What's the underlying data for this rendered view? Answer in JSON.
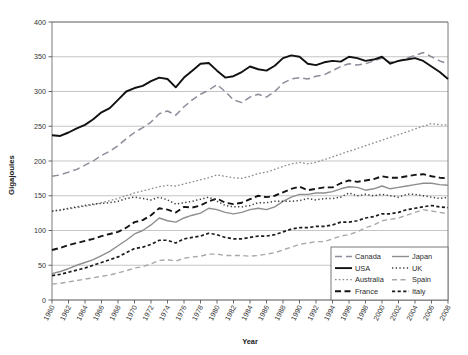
{
  "chart_data": {
    "type": "line",
    "title": "",
    "xlabel": "Year",
    "ylabel": "Gigajoules",
    "xlim": [
      1960,
      2008
    ],
    "ylim": [
      0,
      400
    ],
    "ytick_step": 50,
    "xtick_step": 2,
    "grid": true,
    "legend_position": "bottom-right",
    "yticks": [
      "0",
      "50",
      "100",
      "150",
      "200",
      "250",
      "300",
      "350",
      "400"
    ],
    "xticks": [
      "1960",
      "1962",
      "1964",
      "1966",
      "1968",
      "1970",
      "1972",
      "1974",
      "1976",
      "1978",
      "1980",
      "1982",
      "1984",
      "1986",
      "1988",
      "1990",
      "1992",
      "1994",
      "1996",
      "1998",
      "2000",
      "2002",
      "2004",
      "2006",
      "2008"
    ],
    "x": [
      1960,
      1961,
      1962,
      1963,
      1964,
      1965,
      1966,
      1967,
      1968,
      1969,
      1970,
      1971,
      1972,
      1973,
      1974,
      1975,
      1976,
      1977,
      1978,
      1979,
      1980,
      1981,
      1982,
      1983,
      1984,
      1985,
      1986,
      1987,
      1988,
      1989,
      1990,
      1991,
      1992,
      1993,
      1994,
      1995,
      1996,
      1997,
      1998,
      1999,
      2000,
      2001,
      2002,
      2003,
      2004,
      2005,
      2006,
      2007,
      2008
    ],
    "series": [
      {
        "name": "Canada",
        "style": "dashed",
        "color": "#8c8c9a",
        "width": 1.5,
        "dash": "7,4",
        "values": [
          178,
          180,
          184,
          188,
          194,
          200,
          208,
          214,
          222,
          232,
          241,
          248,
          256,
          268,
          272,
          266,
          278,
          288,
          296,
          302,
          310,
          300,
          288,
          284,
          292,
          296,
          292,
          300,
          312,
          318,
          320,
          318,
          322,
          324,
          330,
          336,
          340,
          338,
          340,
          344,
          348,
          342,
          344,
          348,
          352,
          356,
          350,
          344,
          340
        ]
      },
      {
        "name": "USA",
        "style": "solid",
        "color": "#111111",
        "width": 1.9,
        "dash": "none",
        "values": [
          237,
          236,
          241,
          247,
          252,
          260,
          270,
          276,
          288,
          300,
          305,
          308,
          315,
          320,
          318,
          306,
          320,
          330,
          340,
          341,
          330,
          320,
          322,
          328,
          336,
          332,
          330,
          337,
          348,
          352,
          350,
          340,
          338,
          342,
          344,
          343,
          350,
          348,
          344,
          346,
          350,
          340,
          344,
          346,
          348,
          344,
          336,
          328,
          318
        ]
      },
      {
        "name": "Australia",
        "style": "fine-dotted",
        "color": "#8a8a8a",
        "width": 1.3,
        "dash": "1.6,2.2",
        "values": [
          128,
          130,
          131,
          133,
          135,
          137,
          140,
          143,
          146,
          150,
          154,
          157,
          160,
          163,
          165,
          164,
          167,
          170,
          173,
          176,
          180,
          178,
          176,
          175,
          178,
          182,
          184,
          188,
          192,
          196,
          198,
          196,
          198,
          202,
          206,
          210,
          214,
          218,
          222,
          226,
          230,
          234,
          238,
          242,
          246,
          250,
          254,
          252,
          252
        ]
      },
      {
        "name": "France",
        "style": "long-dash",
        "color": "#141414",
        "width": 1.9,
        "dash": "6,3.5",
        "values": [
          72,
          75,
          79,
          82,
          85,
          88,
          92,
          95,
          98,
          104,
          112,
          115,
          122,
          132,
          130,
          126,
          134,
          133,
          136,
          142,
          146,
          140,
          138,
          140,
          145,
          150,
          148,
          150,
          155,
          160,
          163,
          158,
          160,
          162,
          162,
          168,
          172,
          170,
          172,
          174,
          178,
          176,
          176,
          178,
          180,
          181,
          178,
          176,
          175
        ]
      },
      {
        "name": "Japan",
        "style": "solid-thin",
        "color": "#8e8e8e",
        "width": 1.4,
        "dash": "none",
        "values": [
          38,
          41,
          45,
          50,
          54,
          58,
          64,
          70,
          78,
          86,
          95,
          100,
          108,
          118,
          114,
          112,
          118,
          122,
          125,
          132,
          130,
          126,
          124,
          126,
          130,
          132,
          130,
          134,
          142,
          148,
          152,
          152,
          154,
          154,
          156,
          160,
          163,
          162,
          158,
          160,
          164,
          160,
          162,
          164,
          166,
          168,
          168,
          166,
          165
        ]
      },
      {
        "name": "UK",
        "style": "dotted",
        "color": "#3a3a3a",
        "width": 1.5,
        "dash": "1.3,2.4",
        "values": [
          128,
          129,
          132,
          134,
          136,
          138,
          139,
          140,
          142,
          146,
          148,
          146,
          144,
          148,
          144,
          138,
          140,
          142,
          145,
          148,
          142,
          136,
          134,
          134,
          136,
          140,
          140,
          142,
          142,
          142,
          143,
          146,
          144,
          146,
          146,
          148,
          154,
          150,
          152,
          150,
          152,
          150,
          148,
          152,
          152,
          150,
          148,
          146,
          148
        ]
      },
      {
        "name": "Spain",
        "style": "light-dash",
        "color": "#a8a8a8",
        "width": 1.4,
        "dash": "5,3.5",
        "values": [
          23,
          24,
          26,
          28,
          30,
          32,
          34,
          36,
          39,
          42,
          46,
          48,
          52,
          57,
          58,
          56,
          60,
          62,
          63,
          66,
          66,
          64,
          64,
          64,
          63,
          64,
          66,
          68,
          72,
          76,
          80,
          82,
          84,
          84,
          88,
          92,
          94,
          98,
          104,
          108,
          114,
          116,
          118,
          122,
          126,
          130,
          128,
          126,
          124
        ]
      },
      {
        "name": "Italy",
        "style": "short-dash",
        "color": "#1c1c1c",
        "width": 1.7,
        "dash": "3.2,2.4",
        "values": [
          35,
          37,
          40,
          43,
          46,
          50,
          54,
          58,
          62,
          68,
          74,
          76,
          80,
          86,
          86,
          82,
          88,
          90,
          92,
          96,
          94,
          90,
          88,
          88,
          90,
          92,
          92,
          94,
          98,
          102,
          104,
          104,
          106,
          106,
          108,
          112,
          112,
          114,
          118,
          120,
          124,
          124,
          126,
          130,
          132,
          134,
          136,
          134,
          133
        ]
      }
    ],
    "legend_columns": [
      [
        "Canada",
        "USA",
        "Australia",
        "France"
      ],
      [
        "Japan",
        "UK",
        "Spain",
        "Italy"
      ]
    ]
  }
}
